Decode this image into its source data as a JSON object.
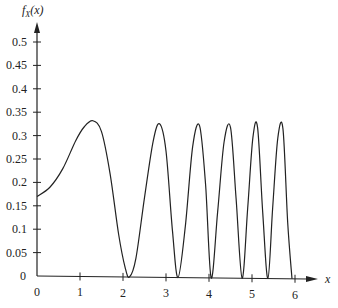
{
  "chart_data": {
    "type": "line",
    "title": "",
    "xlabel": "x",
    "ylabel": "f_X(x)",
    "ylabel_display": {
      "f": "f",
      "sub": "X",
      "arg": "(x)"
    },
    "xlim": [
      0,
      6
    ],
    "ylim": [
      0,
      0.5
    ],
    "grid": false,
    "legend": null,
    "x_ticks": [
      0,
      1,
      2,
      3,
      4,
      5,
      6
    ],
    "x_tick_labels": [
      "0",
      "1",
      "2",
      "3",
      "4",
      "5",
      "6"
    ],
    "y_ticks": [
      0,
      0.05,
      0.1,
      0.15,
      0.2,
      0.25,
      0.3,
      0.35,
      0.4,
      0.45,
      0.5
    ],
    "y_tick_labels": [
      "0",
      "0.05",
      "0.1",
      "0.15",
      "0.2",
      "0.25",
      "0.3",
      "0.35",
      "0.4",
      "0.45",
      "0.5"
    ],
    "series": [
      {
        "name": "f_X(x)",
        "x": [
          0,
          0.3,
          0.6,
          0.9,
          1.1,
          1.3,
          1.5,
          1.7,
          1.9,
          2.05,
          2.15,
          2.3,
          2.5,
          2.7,
          2.85,
          3.0,
          3.15,
          3.28,
          3.45,
          3.62,
          3.78,
          3.92,
          4.05,
          4.2,
          4.35,
          4.5,
          4.63,
          4.77,
          4.9,
          5.02,
          5.13,
          5.25,
          5.37,
          5.48,
          5.6,
          5.72,
          5.83,
          5.93
        ],
        "y": [
          0.17,
          0.19,
          0.23,
          0.29,
          0.32,
          0.333,
          0.31,
          0.22,
          0.09,
          0.02,
          0.0,
          0.04,
          0.17,
          0.29,
          0.328,
          0.27,
          0.1,
          0.0,
          0.11,
          0.28,
          0.325,
          0.2,
          0.0,
          0.14,
          0.29,
          0.322,
          0.17,
          0.0,
          0.15,
          0.3,
          0.322,
          0.14,
          0.0,
          0.15,
          0.3,
          0.32,
          0.12,
          0.0
        ]
      }
    ]
  },
  "colors": {
    "line": "#222222",
    "axis": "#222222",
    "background": "#ffffff"
  }
}
